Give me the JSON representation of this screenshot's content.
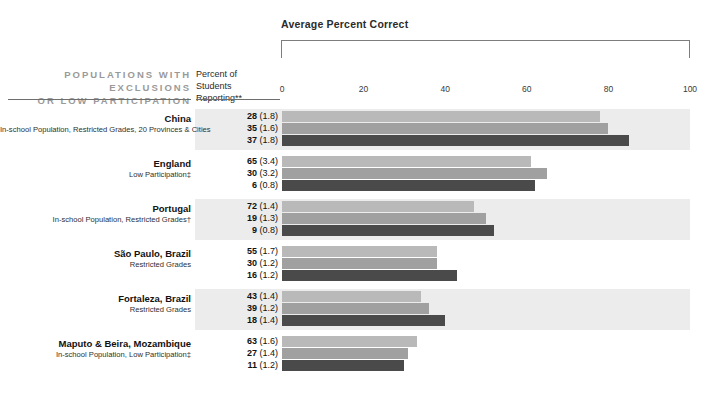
{
  "header": {
    "axis_title": "Average Percent Correct",
    "left_title_line1": "POPULATIONS WITH EXCLUSIONS",
    "left_title_line2": "OR LOW PARTICIPATION",
    "pct_col_line1": "Percent of",
    "pct_col_line2": "Students Reporting**"
  },
  "chart_data": {
    "type": "bar",
    "title": "Average Percent Correct",
    "xlabel": "",
    "ylabel": "",
    "xlim": [
      0,
      100
    ],
    "ticks": [
      0,
      20,
      40,
      60,
      80,
      100
    ],
    "grid": false,
    "legend_position": "none",
    "orientation": "horizontal",
    "categories": [
      "China",
      "England",
      "Portugal",
      "São Paulo, Brazil",
      "Fortaleza, Brazil",
      "Maputo & Beira, Mozambique"
    ],
    "series": [
      {
        "name": "band-1",
        "values": [
          78,
          61,
          47,
          38,
          34,
          33
        ]
      },
      {
        "name": "band-2",
        "values": [
          80,
          65,
          50,
          38,
          36,
          31
        ]
      },
      {
        "name": "band-3",
        "values": [
          85,
          62,
          52,
          43,
          40,
          30
        ]
      }
    ]
  },
  "rows": [
    {
      "name": "China",
      "sub": "In-school Population, Restricted Grades, 20 Provinces & Cities",
      "values": [
        {
          "pct": "28",
          "se": "(1.8)",
          "bar": 78
        },
        {
          "pct": "35",
          "se": "(1.6)",
          "bar": 80
        },
        {
          "pct": "37",
          "se": "(1.8)",
          "bar": 85
        }
      ]
    },
    {
      "name": "England",
      "sub": "Low Participation‡",
      "values": [
        {
          "pct": "65",
          "se": "(3.4)",
          "bar": 61
        },
        {
          "pct": "30",
          "se": "(3.2)",
          "bar": 65
        },
        {
          "pct": "6",
          "se": "(0.8)",
          "bar": 62
        }
      ]
    },
    {
      "name": "Portugal",
      "sub": "In-school Population, Restricted Grades†",
      "values": [
        {
          "pct": "72",
          "se": "(1.4)",
          "bar": 47
        },
        {
          "pct": "19",
          "se": "(1.3)",
          "bar": 50
        },
        {
          "pct": "9",
          "se": "(0.8)",
          "bar": 52
        }
      ]
    },
    {
      "name": "São Paulo, Brazil",
      "sub": "Restricted Grades",
      "values": [
        {
          "pct": "55",
          "se": "(1.7)",
          "bar": 38
        },
        {
          "pct": "30",
          "se": "(1.2)",
          "bar": 38
        },
        {
          "pct": "16",
          "se": "(1.2)",
          "bar": 43
        }
      ]
    },
    {
      "name": "Fortaleza, Brazil",
      "sub": "Restricted Grades",
      "values": [
        {
          "pct": "43",
          "se": "(1.4)",
          "bar": 34
        },
        {
          "pct": "39",
          "se": "(1.2)",
          "bar": 36
        },
        {
          "pct": "18",
          "se": "(1.4)",
          "bar": 40
        }
      ]
    },
    {
      "name": "Maputo & Beira, Mozambique",
      "sub": "In-school Population, Low Participation‡",
      "values": [
        {
          "pct": "63",
          "se": "(1.6)",
          "bar": 33
        },
        {
          "pct": "27",
          "se": "(1.4)",
          "bar": 31
        },
        {
          "pct": "11",
          "se": "(1.2)",
          "bar": 30
        }
      ]
    }
  ],
  "colors": {
    "band_light": "#b9b9b9",
    "band_mid": "#a0a0a0",
    "band_dark": "#4a4a4a",
    "row_bg": "#ececec",
    "header_gray": "#9a9a9a"
  }
}
